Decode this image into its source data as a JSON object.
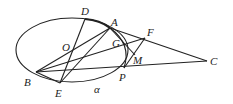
{
  "diagram": {
    "type": "geometry",
    "labels": {
      "D": "D",
      "A": "A",
      "O": "O",
      "G": "G",
      "F": "F",
      "M": "M",
      "B": "B",
      "E": "E",
      "P": "P",
      "C": "C",
      "alpha": "α"
    },
    "points": {
      "D": [
        85,
        19
      ],
      "A": [
        110,
        28
      ],
      "O": [
        75,
        47
      ],
      "G": [
        126,
        45
      ],
      "F": [
        145,
        38
      ],
      "M": [
        135,
        55
      ],
      "P": [
        124,
        68
      ],
      "C": [
        207,
        61
      ],
      "B": [
        36,
        72
      ],
      "E": [
        60,
        83
      ]
    },
    "ellipse": {
      "cx": 72,
      "cy": 50,
      "rx": 56,
      "ry": 32
    },
    "stroke_color": "#222222"
  }
}
